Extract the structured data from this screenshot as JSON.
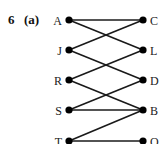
{
  "question": {
    "number": "6",
    "part": "(a)"
  },
  "graph": {
    "type": "bipartite",
    "left_nodes": [
      {
        "id": "A",
        "label": "A",
        "x": 69,
        "y": 20
      },
      {
        "id": "J",
        "label": "J",
        "x": 69,
        "y": 50
      },
      {
        "id": "R",
        "label": "R",
        "x": 69,
        "y": 80
      },
      {
        "id": "S",
        "label": "S",
        "x": 69,
        "y": 110
      },
      {
        "id": "T",
        "label": "T",
        "x": 69,
        "y": 141
      }
    ],
    "right_nodes": [
      {
        "id": "C",
        "label": "C",
        "x": 143,
        "y": 20
      },
      {
        "id": "L",
        "label": "L",
        "x": 143,
        "y": 50
      },
      {
        "id": "D",
        "label": "D",
        "x": 143,
        "y": 80
      },
      {
        "id": "B",
        "label": "B",
        "x": 143,
        "y": 110
      },
      {
        "id": "O",
        "label": "O",
        "x": 143,
        "y": 141
      }
    ],
    "edges": [
      [
        "A",
        "C"
      ],
      [
        "A",
        "L"
      ],
      [
        "J",
        "C"
      ],
      [
        "J",
        "D"
      ],
      [
        "R",
        "L"
      ],
      [
        "R",
        "B"
      ],
      [
        "S",
        "D"
      ],
      [
        "S",
        "B"
      ],
      [
        "T",
        "B"
      ],
      [
        "T",
        "O"
      ]
    ]
  }
}
